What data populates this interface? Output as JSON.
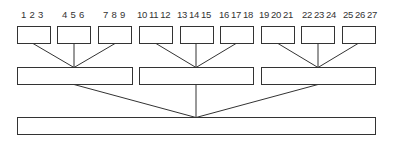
{
  "diagram": {
    "type": "tree",
    "levels": 3,
    "colors": {
      "stroke": "#333333",
      "fill": "#ffffff",
      "text": "#333333"
    },
    "leaf_labels": [
      {
        "text": "1 2 3",
        "x": 21
      },
      {
        "text": "4 5 6",
        "x": 62
      },
      {
        "text": "7 8 9",
        "x": 103
      },
      {
        "text": "10 11 12",
        "x": 138
      },
      {
        "text": "13 14 15",
        "x": 178
      },
      {
        "text": "16 17 18",
        "x": 220
      },
      {
        "text": "19 20 21",
        "x": 260
      },
      {
        "text": "22 23 24",
        "x": 303
      },
      {
        "text": "25 26 27",
        "x": 345
      }
    ],
    "top_nodes": [
      {
        "x": 17,
        "w": 33
      },
      {
        "x": 57,
        "w": 33
      },
      {
        "x": 98,
        "w": 33
      },
      {
        "x": 139,
        "w": 33
      },
      {
        "x": 180,
        "w": 33
      },
      {
        "x": 220,
        "w": 33
      },
      {
        "x": 261,
        "w": 33
      },
      {
        "x": 301,
        "w": 33
      },
      {
        "x": 342,
        "w": 33
      }
    ],
    "middle_nodes": [
      {
        "x": 17,
        "w": 115
      },
      {
        "x": 139,
        "w": 114
      },
      {
        "x": 261,
        "w": 114
      }
    ],
    "root_node": {
      "x": 17,
      "w": 358
    }
  }
}
